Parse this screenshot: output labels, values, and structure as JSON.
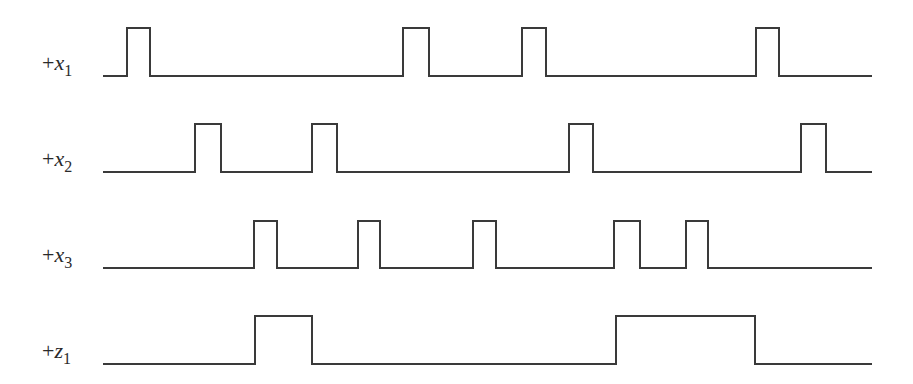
{
  "diagram": {
    "type": "timing-diagram",
    "line_color": "#3a3a3a",
    "x_start": 103,
    "x_end": 872,
    "signals": [
      {
        "id": "x1",
        "prefix": "+",
        "variable": "x",
        "subscript": "1",
        "label_baseline_y": 70,
        "low_y": 76,
        "high_y": 28,
        "pulses": [
          [
            127,
            150
          ],
          [
            403,
            429
          ],
          [
            522,
            546
          ],
          [
            756,
            779
          ]
        ]
      },
      {
        "id": "x2",
        "prefix": "+",
        "variable": "x",
        "subscript": "2",
        "label_baseline_y": 166,
        "low_y": 172,
        "high_y": 124,
        "pulses": [
          [
            195,
            221
          ],
          [
            312,
            337
          ],
          [
            569,
            593
          ],
          [
            801,
            826
          ]
        ]
      },
      {
        "id": "x3",
        "prefix": "+",
        "variable": "x",
        "subscript": "3",
        "label_baseline_y": 262,
        "low_y": 268,
        "high_y": 221,
        "pulses": [
          [
            254,
            277
          ],
          [
            358,
            380
          ],
          [
            473,
            496
          ],
          [
            614,
            640
          ],
          [
            686,
            708
          ]
        ]
      },
      {
        "id": "z1",
        "prefix": "+",
        "variable": "z",
        "subscript": "1",
        "label_baseline_y": 358,
        "low_y": 364,
        "high_y": 316,
        "pulses": [
          [
            255,
            312
          ],
          [
            616,
            755
          ]
        ]
      }
    ]
  }
}
